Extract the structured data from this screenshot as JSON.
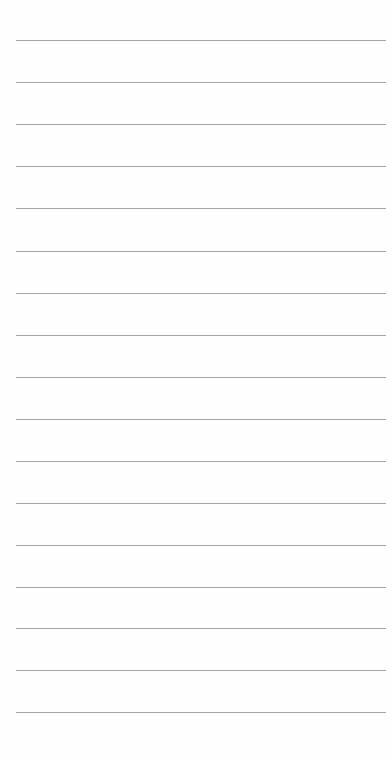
{
  "page": {
    "type": "lined-paper",
    "background_color": "#fefefe",
    "line_color": "#a6a6a6",
    "line_count": 17,
    "first_line_y": 40,
    "line_spacing": 42,
    "lines": [
      {
        "y": 40
      },
      {
        "y": 82
      },
      {
        "y": 124
      },
      {
        "y": 166
      },
      {
        "y": 208
      },
      {
        "y": 251
      },
      {
        "y": 293
      },
      {
        "y": 335
      },
      {
        "y": 377
      },
      {
        "y": 419
      },
      {
        "y": 461
      },
      {
        "y": 503
      },
      {
        "y": 545
      },
      {
        "y": 587
      },
      {
        "y": 628
      },
      {
        "y": 670
      },
      {
        "y": 712
      }
    ]
  }
}
